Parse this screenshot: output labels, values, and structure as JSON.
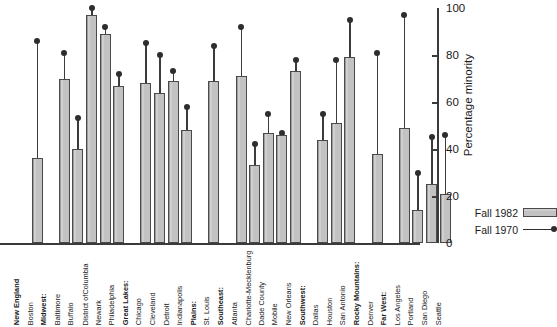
{
  "chart_data": {
    "type": "bar",
    "title": "",
    "xlabel": "",
    "ylabel": "Percentage minority",
    "ylim": [
      0,
      100
    ],
    "yticks": [
      0,
      20,
      40,
      60,
      80,
      100
    ],
    "grid": false,
    "legend_position": "bottom-right",
    "series": [
      {
        "name": "Fall 1982",
        "marker": "bar",
        "values": [
          36,
          70,
          40,
          97,
          89,
          67,
          68,
          64,
          69,
          48,
          69,
          71,
          33,
          47,
          46,
          73,
          44,
          51,
          79,
          38,
          49,
          14,
          25,
          21
        ]
      },
      {
        "name": "Fall 1970",
        "marker": "line-dot",
        "values": [
          86,
          81,
          53,
          100,
          92,
          72,
          85,
          80,
          73,
          58,
          84,
          92,
          42,
          55,
          47,
          78,
          55,
          78,
          95,
          81,
          97,
          30,
          45,
          46
        ]
      }
    ],
    "categories": [
      "Boston",
      "Baltimore",
      "Buffalo",
      "District of Columbia",
      "Newark",
      "Philadelphia",
      "Chicago",
      "Cleveland",
      "Detroit",
      "Indianapolis",
      "St. Louis",
      "Atlanta",
      "Charlotte-Mecklenburg",
      "Dade County",
      "Mobile",
      "New Orleans",
      "Dallas",
      "Houston",
      "San Antonio",
      "Denver",
      "Los Angeles",
      "Portland",
      "San Diego",
      "Seattle"
    ],
    "group_headers": [
      "New England",
      "Midwest:",
      "Great Lakes:",
      "Plains:",
      "Southeast:",
      "Southwest:",
      "Rocky Mountains:",
      "Far West:"
    ]
  },
  "axis": {
    "title": "Percentage minority",
    "tick_labels": [
      "0",
      "20",
      "40",
      "60",
      "80",
      "100"
    ]
  },
  "legend": {
    "items": [
      {
        "label": "Fall 1982",
        "kind": "swatch",
        "color": "#c2c2c2"
      },
      {
        "label": "Fall 1970",
        "kind": "line-dot",
        "color": "#2e2e2e"
      }
    ]
  },
  "columns": [
    {
      "kind": "header",
      "label": "New England",
      "bold": true
    },
    {
      "kind": "item",
      "label": "Boston",
      "bar": 36,
      "dot": 86
    },
    {
      "kind": "header",
      "label": "Midwest:",
      "bold": true
    },
    {
      "kind": "item",
      "label": "Baltimore",
      "bar": 70,
      "dot": 81
    },
    {
      "kind": "item",
      "label": "Buffalo",
      "bar": 40,
      "dot": 53
    },
    {
      "kind": "item",
      "label": "District of Columbia",
      "bar": 97,
      "dot": 100,
      "wrap": "District of|Columbia"
    },
    {
      "kind": "item",
      "label": "Newark",
      "bar": 89,
      "dot": 92
    },
    {
      "kind": "item",
      "label": "Philadelphia",
      "bar": 67,
      "dot": 72
    },
    {
      "kind": "header",
      "label": "Great Lakes:",
      "bold": true
    },
    {
      "kind": "item",
      "label": "Chicago",
      "bar": 68,
      "dot": 85
    },
    {
      "kind": "item",
      "label": "Cleveland",
      "bar": 64,
      "dot": 80
    },
    {
      "kind": "item",
      "label": "Detroit",
      "bar": 69,
      "dot": 73
    },
    {
      "kind": "item",
      "label": "Indianapolis",
      "bar": 48,
      "dot": 58
    },
    {
      "kind": "header",
      "label": "Plains:",
      "bold": true
    },
    {
      "kind": "item",
      "label": "St. Louis",
      "bar": 69,
      "dot": 84
    },
    {
      "kind": "header",
      "label": "Southeast:",
      "bold": true
    },
    {
      "kind": "item",
      "label": "Atlanta",
      "bar": 71,
      "dot": 92
    },
    {
      "kind": "item",
      "label": "Charlotte-Mecklenburg",
      "bar": 33,
      "dot": 42,
      "wrap": "Charlotte-|Mecklenburg"
    },
    {
      "kind": "item",
      "label": "Dade County",
      "bar": 47,
      "dot": 55
    },
    {
      "kind": "item",
      "label": "Mobile",
      "bar": 46,
      "dot": 47
    },
    {
      "kind": "item",
      "label": "New Orleans",
      "bar": 73,
      "dot": 78
    },
    {
      "kind": "header",
      "label": "Southwest:",
      "bold": true
    },
    {
      "kind": "item",
      "label": "Dallas",
      "bar": 44,
      "dot": 55
    },
    {
      "kind": "item",
      "label": "Houston",
      "bar": 51,
      "dot": 78
    },
    {
      "kind": "item",
      "label": "San Antonio",
      "bar": 79,
      "dot": 95
    },
    {
      "kind": "header",
      "label": "Rocky Mountains:",
      "bold": true
    },
    {
      "kind": "item",
      "label": "Denver",
      "bar": 38,
      "dot": 81
    },
    {
      "kind": "header",
      "label": "Far West:",
      "bold": true
    },
    {
      "kind": "item",
      "label": "Los Angeles",
      "bar": 49,
      "dot": 97
    },
    {
      "kind": "item",
      "label": "Portland",
      "bar": 14,
      "dot": 30
    },
    {
      "kind": "item",
      "label": "San Diego",
      "bar": 25,
      "dot": 45
    },
    {
      "kind": "item",
      "label": "Seattle",
      "bar": 21,
      "dot": 46
    }
  ]
}
